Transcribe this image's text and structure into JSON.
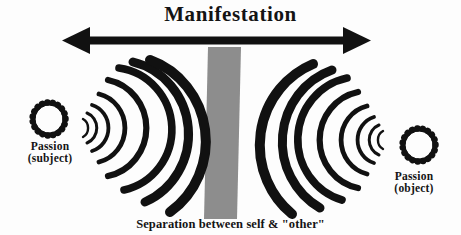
{
  "diagram": {
    "title": "Manifestation",
    "caption": "Separation between self & \"other\"",
    "nodes": [
      {
        "id": "left",
        "label_line1": "Passion",
        "label_line2": "(subject)",
        "icon": "scalloped-ring-icon"
      },
      {
        "id": "right",
        "label_line1": "Passion",
        "label_line2": "(object)",
        "icon": "scalloped-ring-icon"
      }
    ],
    "arrow": {
      "name": "double-headed-arrow",
      "direction": "bidirectional",
      "label": "Manifestation"
    },
    "divider": {
      "name": "separation-band",
      "label": "Separation between self & \"other\""
    },
    "waves": {
      "left_cluster_name": "radiating-arcs-left",
      "right_cluster_name": "radiating-arcs-right",
      "arcs_per_cluster": 7
    },
    "colors": {
      "ink": "#141414",
      "band_gray": "#8d8d8d",
      "background": "#fdfdfd"
    }
  }
}
